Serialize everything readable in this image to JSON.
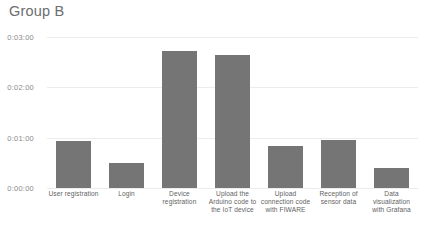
{
  "chart_data": {
    "type": "bar",
    "title": "Group B",
    "xlabel": "",
    "ylabel": "",
    "grid": true,
    "legend": false,
    "ylim": [
      "0:00:00",
      "0:03:00"
    ],
    "ytick_labels": [
      "0:03:00",
      "0:02:00",
      "0:01:00",
      "0:00:00"
    ],
    "ytick_seconds": [
      180,
      120,
      60,
      0
    ],
    "categories": [
      "User registration",
      "Login",
      "Device registration",
      "Upload the Arduino code to the IoT device",
      "Upload connection code with FIWARE",
      "Reception of sensor data",
      "Data visualization with Grafana"
    ],
    "values": [
      "0:00:56",
      "0:00:30",
      "0:02:43",
      "0:02:38",
      "0:00:50",
      "0:00:57",
      "0:00:24"
    ],
    "values_seconds": [
      56,
      30,
      163,
      158,
      50,
      57,
      24
    ],
    "bar_color": "#757575",
    "grid_color": "#ececec"
  },
  "caption": {
    "text": ""
  }
}
